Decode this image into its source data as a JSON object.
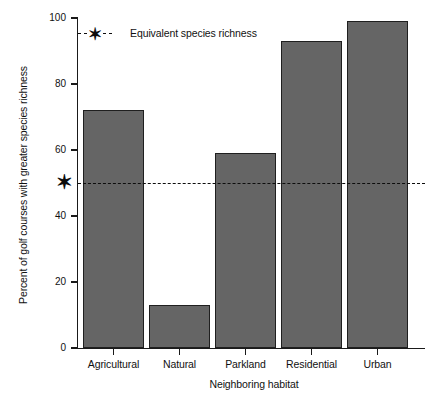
{
  "chart_data": {
    "type": "bar",
    "title": "",
    "categories": [
      "Agricultural",
      "Natural",
      "Parkland",
      "Residential",
      "Urban"
    ],
    "values": [
      72,
      13,
      59,
      93,
      99
    ],
    "xlabel": "Neighboring habitat",
    "ylabel": "Percent of golf courses with greater species richness",
    "ylim": [
      0,
      100
    ],
    "yticks": [
      0,
      20,
      40,
      60,
      80,
      100
    ],
    "ytick_labels": [
      "0",
      "20",
      "40",
      "60",
      "80",
      "100"
    ],
    "grid": false,
    "legend_position": "top-left",
    "legend": [
      {
        "label": "Equivalent species richness",
        "marker": "asterisk",
        "linestyle": "dashed"
      }
    ],
    "annotations": [
      {
        "type": "hline",
        "value": 50,
        "label": "Equivalent species richness",
        "marker": "asterisk",
        "linestyle": "dashed"
      }
    ],
    "colors": {
      "bar_fill": "#656565",
      "bar_edge": "#1f1f1f",
      "axis": "#1a1a1a",
      "refline": "#0d0d0d",
      "background": "#ffffff"
    }
  },
  "icons": {
    "asterisk_glyph": "✶",
    "legend_marker_name": "asterisk-marker"
  }
}
